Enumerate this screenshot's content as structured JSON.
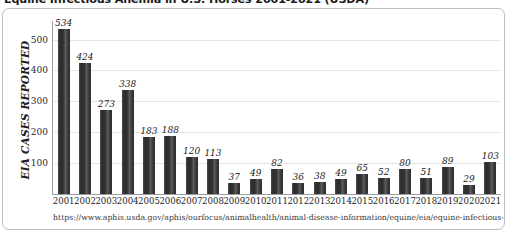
{
  "chart_data": {
    "type": "bar",
    "title": "Equine Infectious Anemia in U.S. Horses 2001-2021 (USDA)",
    "xlabel": "",
    "ylabel": "EIA CASES REPORTED",
    "ylim": [
      0,
      560
    ],
    "yticks": [
      100,
      200,
      300,
      400,
      500
    ],
    "grid": true,
    "legend": "none",
    "categories": [
      "2001",
      "2002",
      "2003",
      "2004",
      "2005",
      "2006",
      "2007",
      "2008",
      "2009",
      "2010",
      "2011",
      "2012",
      "2013",
      "2014",
      "2015",
      "2016",
      "2017",
      "2018",
      "2019",
      "2020",
      "2021"
    ],
    "values": [
      534,
      424,
      273,
      338,
      183,
      188,
      120,
      113,
      37,
      49,
      82,
      36,
      38,
      49,
      65,
      52,
      80,
      51,
      89,
      29,
      103
    ],
    "data_labels": [
      "534",
      "424",
      "273",
      "338",
      "183",
      "188",
      "120",
      "113",
      "37",
      "49",
      "82",
      "36",
      "38",
      "49",
      "65",
      "52",
      "80",
      "51",
      "89",
      "29",
      "103"
    ],
    "bar_color": "#333333",
    "gridline_color": "#e4e5e7",
    "axis_color": "#9a9da1"
  },
  "source_note": "https://www.aphis.usda.gov/aphis/ourfocus/animalhealth/animal-disease-information/equine/eia/equine-infectious-anemia (8/2023)"
}
